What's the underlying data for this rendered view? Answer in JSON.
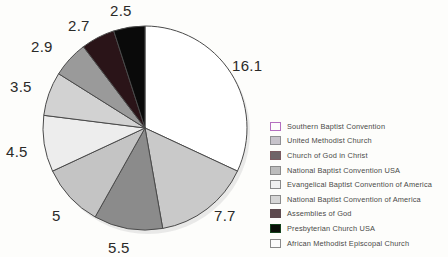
{
  "chart_data": {
    "type": "pie",
    "title": "",
    "xlabel": "",
    "ylabel": "",
    "start_angle_deg": 0,
    "direction": "clockwise",
    "legend_position": "right",
    "grid": false,
    "total": 50.4,
    "categories": [
      "Southern Baptist Convention",
      "United Methodist Church",
      "Church of God in Christ",
      "National Baptist Convention USA",
      "Evangelical Baptist Convention of America",
      "National Baptist Convention of America",
      "Assemblies of God",
      "Presbyterian Church USA",
      "African Methodist Episcopal Church"
    ],
    "values": [
      16.1,
      7.7,
      5.5,
      5,
      4.5,
      3.5,
      2.9,
      2.7,
      2.5
    ],
    "labels": [
      "16.1",
      "7.7",
      "5.5",
      "5",
      "4.5",
      "3.5",
      "2.9",
      "2.7",
      "2.5"
    ],
    "colors": [
      "#ffffff",
      "#c9c9c9",
      "#8b8b8b",
      "#c4c4c4",
      "#ededed",
      "#d2d2d2",
      "#9a9a9a",
      "#2a1418",
      "#0a0a0a"
    ],
    "slice_stroke": "#4a4a4a"
  },
  "pie": {
    "center_x": 145,
    "center_y": 128,
    "radius": 102,
    "labels": [
      {
        "text": "16.1",
        "x": 232,
        "y": 57
      },
      {
        "text": "7.7",
        "x": 214,
        "y": 207
      },
      {
        "text": "5.5",
        "x": 108,
        "y": 239
      },
      {
        "text": "5",
        "x": 52,
        "y": 207
      },
      {
        "text": "4.5",
        "x": 6,
        "y": 143
      },
      {
        "text": "3.5",
        "x": 10,
        "y": 78
      },
      {
        "text": "2.9",
        "x": 31,
        "y": 38
      },
      {
        "text": "2.7",
        "x": 68,
        "y": 17
      },
      {
        "text": "2.5",
        "x": 110,
        "y": 2
      }
    ]
  },
  "legend": {
    "items": [
      {
        "label": "Southern Baptist Convention",
        "color": "#fdfdfd",
        "border": "#b46fc0"
      },
      {
        "label": "United Methodist Church",
        "color": "#c7c3cb",
        "border": "#8f8f93"
      },
      {
        "label": "Church of God in Christ",
        "color": "#6f6468",
        "border": "#7a5a60"
      },
      {
        "label": "National Baptist Convention USA",
        "color": "#bcbcbc",
        "border": "#8a8a8a"
      },
      {
        "label": "Evangelical Baptist Convention of America",
        "color": "#f0f0f0",
        "border": "#8a8a8a"
      },
      {
        "label": "National Baptist Convention of America",
        "color": "#d6d6d6",
        "border": "#8a8a8a"
      },
      {
        "label": "Assemblies of God",
        "color": "#5d4a4e",
        "border": "#5d4a4e"
      },
      {
        "label": "Presbyterian Church USA",
        "color": "#0a0f08",
        "border": "#14421c"
      },
      {
        "label": "African Methodist Episcopal Church",
        "color": "#fcfcfc",
        "border": "#8a8a8a"
      }
    ]
  }
}
